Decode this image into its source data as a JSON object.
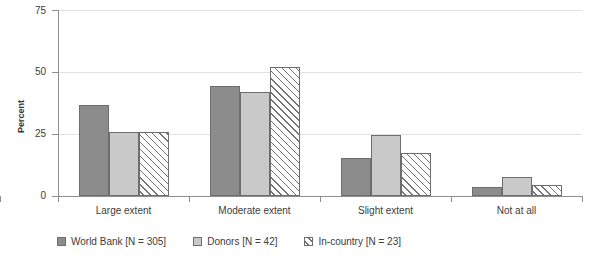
{
  "chart_data": {
    "type": "bar",
    "title": "",
    "xlabel": "",
    "ylabel": "Percent",
    "ylim": [
      0,
      75
    ],
    "yticks": [
      0,
      25,
      50,
      75
    ],
    "ytick_labels": [
      "0",
      "25",
      "50",
      "75"
    ],
    "grid": true,
    "legend_position": "bottom-left",
    "categories": [
      "Large extent",
      "Moderate extent",
      "Slight extent",
      "Not at all"
    ],
    "series": [
      {
        "name": "World Bank [N = 305]",
        "color": "#8c8c8c",
        "fill": "solid",
        "values": [
          36.5,
          44.5,
          15.5,
          3.5
        ]
      },
      {
        "name": "Donors [N = 42]",
        "color": "#c9c9c9",
        "fill": "solid",
        "values": [
          26.0,
          42.0,
          24.5,
          7.5
        ]
      },
      {
        "name": "In-country [N = 23]",
        "color": "#ffffff",
        "fill": "hatched",
        "values": [
          26.0,
          52.0,
          17.5,
          4.5
        ]
      }
    ]
  },
  "axis": {
    "y_label": "Percent",
    "y_tick_labels": [
      "75",
      "50",
      "25",
      "0"
    ],
    "x_tick_labels": [
      "Large extent",
      "Moderate extent",
      "Slight extent",
      "Not at all"
    ]
  },
  "legend": {
    "items": [
      {
        "label": "World Bank [N = 305]",
        "swatch": "solid-dark-gray-swatch"
      },
      {
        "label": "Donors [N = 42]",
        "swatch": "solid-light-gray-swatch"
      },
      {
        "label": "In-country [N = 23]",
        "swatch": "diagonal-hatch-swatch"
      }
    ]
  },
  "colors": {
    "series_1": "#8c8c8c",
    "series_2": "#c9c9c9",
    "series_3": "#ffffff",
    "bar_outline": "#6d6d6d",
    "axis": "#8f8f8f",
    "gridline": "#e2e2e2",
    "text": "#3c3c3c"
  }
}
